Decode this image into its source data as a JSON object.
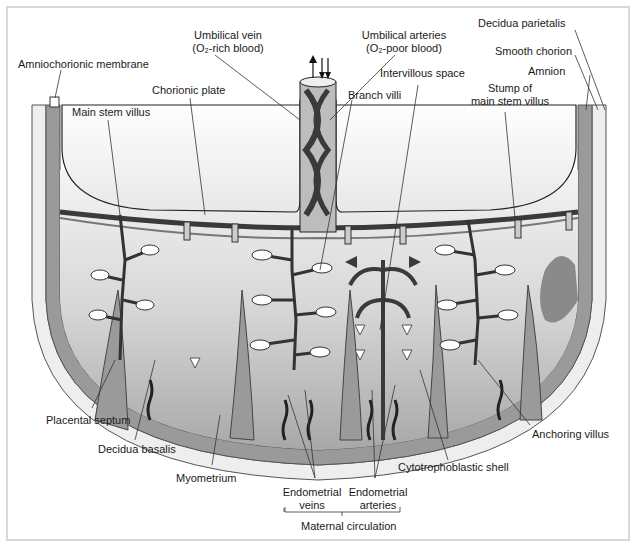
{
  "diagram": {
    "type": "anatomical cross-section",
    "labels": {
      "amniochorionic_membrane": "Amniochorionic membrane",
      "umbilical_vein_line1": "Umbilical vein",
      "umbilical_vein_line2": "(O₂-rich blood)",
      "umbilical_arteries_line1": "Umbilical arteries",
      "umbilical_arteries_line2": "(O₂-poor blood)",
      "decidua_parietalis": "Decidua parietalis",
      "smooth_chorion": "Smooth chorion",
      "amnion": "Amnion",
      "chorionic_plate": "Chorionic plate",
      "main_stem_villus": "Main stem villus",
      "intervillous_space": "Intervillous space",
      "branch_villi": "Branch villi",
      "stump_line1": "Stump of",
      "stump_line2": "main stem villus",
      "placental_septum": "Placental septum",
      "decidua_basalis": "Decidua basalis",
      "myometrium": "Myometrium",
      "endometrial_veins_line1": "Endometrial",
      "endometrial_veins_line2": "veins",
      "endometrial_arteries_line1": "Endometrial",
      "endometrial_arteries_line2": "arteries",
      "maternal_circulation": "Maternal circulation",
      "cytotrophoblastic_shell": "Cytotrophoblastic shell",
      "anchoring_villus": "Anchoring villus"
    },
    "colors": {
      "background": "#ffffff",
      "frame_border": "#d8d8d8",
      "dark_vessel": "#3a3a3a",
      "mid_gray_tissue": "#9a9a9a",
      "light_gray_space": "#d9d9d9",
      "myometrium_band": "#eeeeee",
      "leader_line": "#333333"
    }
  }
}
